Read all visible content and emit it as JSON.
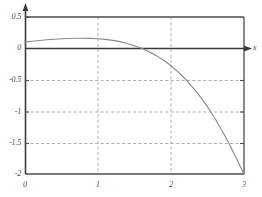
{
  "chart_data": {
    "type": "line",
    "title": "",
    "subtitle": "",
    "xlabel": "x",
    "ylabel": "",
    "xlim": [
      0,
      3
    ],
    "ylim": [
      -2,
      0.5
    ],
    "grid": true,
    "grid_style": "dashed",
    "legend": null,
    "x_ticks": [
      {
        "value": 0,
        "label": "0"
      },
      {
        "value": 1,
        "label": "1"
      },
      {
        "value": 2,
        "label": "2"
      },
      {
        "value": 3,
        "label": "3"
      }
    ],
    "y_ticks": [
      {
        "value": 0.5,
        "label": "0.5"
      },
      {
        "value": 0,
        "label": "0"
      },
      {
        "value": -0.5,
        "label": "-0.5"
      },
      {
        "value": -1,
        "label": "-1"
      },
      {
        "value": -1.5,
        "label": "-1.5"
      },
      {
        "value": -2,
        "label": "-2"
      }
    ],
    "axis_arrows": {
      "x": true,
      "y": true
    },
    "zero_line": true,
    "series": [
      {
        "name": "curve",
        "color": "#8a8a8a",
        "x": [
          0.0,
          0.1,
          0.2,
          0.3,
          0.4,
          0.5,
          0.6,
          0.7,
          0.8,
          0.9,
          1.0,
          1.1,
          1.2,
          1.3,
          1.4,
          1.5,
          1.57,
          1.6,
          1.7,
          1.8,
          1.9,
          2.0,
          2.1,
          2.2,
          2.3,
          2.4,
          2.5,
          2.6,
          2.7,
          2.8,
          2.9,
          3.0
        ],
        "y": [
          0.1,
          0.114,
          0.126,
          0.137,
          0.146,
          0.153,
          0.158,
          0.161,
          0.162,
          0.16,
          0.154,
          0.144,
          0.128,
          0.107,
          0.079,
          0.043,
          0.015,
          0.0,
          -0.052,
          -0.115,
          -0.19,
          -0.277,
          -0.378,
          -0.493,
          -0.623,
          -0.769,
          -0.932,
          -1.112,
          -1.31,
          -1.526,
          -1.761,
          -2.0
        ]
      }
    ],
    "colors": {
      "frame": "#4d4d4d",
      "axis": "#3a3a3a",
      "grid": "#9a9a9a",
      "curve": "#8a8a8a",
      "label": "#4a4a4a",
      "background": "#ffffff"
    }
  }
}
